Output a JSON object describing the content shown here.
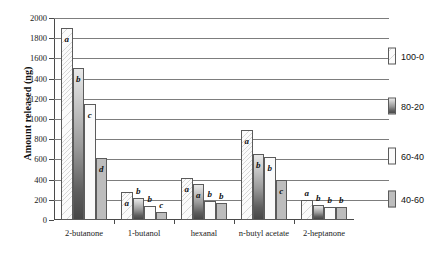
{
  "chart_data": {
    "type": "bar",
    "title": "",
    "xlabel": "",
    "ylabel": "Amount released (ng)",
    "ylim": [
      0,
      2000
    ],
    "ytick_step": 200,
    "yticks": [
      0,
      200,
      400,
      600,
      800,
      1000,
      1200,
      1400,
      1600,
      1800,
      2000
    ],
    "grid": true,
    "legend_position": "right",
    "categories": [
      "2-butanone",
      "1-butanol",
      "hexanal",
      "n-butyl acetate",
      "2-heptanone"
    ],
    "series": [
      {
        "name": "100-0",
        "color": "#fbfbfb",
        "values": [
          1900,
          280,
          420,
          890,
          195
        ],
        "letters": [
          "a",
          "a",
          "a",
          "a",
          "a"
        ]
      },
      {
        "name": "80-20",
        "color": "#9a9a9a",
        "values": [
          1505,
          215,
          360,
          650,
          150
        ],
        "letters": [
          "b",
          "b",
          "a",
          "b",
          "b"
        ]
      },
      {
        "name": "60-40",
        "color": "#fafafa",
        "values": [
          1150,
          140,
          185,
          620,
          130
        ],
        "letters": [
          "c",
          "b",
          "b",
          "b",
          "b"
        ]
      },
      {
        "name": "40-60",
        "color": "#bdbdbd",
        "values": [
          610,
          75,
          165,
          400,
          130
        ],
        "letters": [
          "d",
          "c",
          "b",
          "c",
          "b"
        ]
      }
    ]
  },
  "legend": {
    "items": [
      {
        "label": "100-0"
      },
      {
        "label": "80-20"
      },
      {
        "label": "60-40"
      },
      {
        "label": "40-60"
      }
    ]
  }
}
